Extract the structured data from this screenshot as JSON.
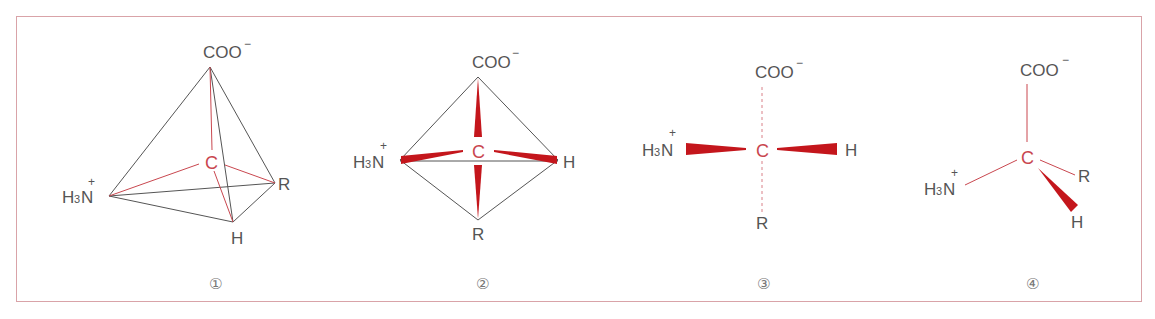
{
  "figure": {
    "border_color": "#d9a3a8",
    "bond_color_black": "#555555",
    "bond_color_red": "#c9474f",
    "wedge_color": "#c4161c",
    "diagrams": [
      {
        "id": "1",
        "caption": "①",
        "style": "tetrahedron",
        "center": "C",
        "top": {
          "main": "COO",
          "charge": "−"
        },
        "left": {
          "main_h": "H",
          "sub": "3",
          "main_n": "N",
          "charge": "+"
        },
        "right": "R",
        "bottom": "H"
      },
      {
        "id": "2",
        "caption": "②",
        "style": "square-planar-wedge",
        "center": "C",
        "top": {
          "main": "COO",
          "charge": "−"
        },
        "left": {
          "main_h": "H",
          "sub": "3",
          "main_n": "N",
          "charge": "+"
        },
        "right": "H",
        "bottom": "R"
      },
      {
        "id": "3",
        "caption": "③",
        "style": "fischer-wedge-dash",
        "center": "C",
        "top": {
          "main": "COO",
          "charge": "−"
        },
        "left": {
          "main_h": "H",
          "sub": "3",
          "main_n": "N",
          "charge": "+"
        },
        "right": "H",
        "bottom": "R"
      },
      {
        "id": "4",
        "caption": "④",
        "style": "wedge-line",
        "center": "C",
        "top": {
          "main": "COO",
          "charge": "−"
        },
        "left": {
          "main_h": "H",
          "sub": "3",
          "main_n": "N",
          "charge": "+"
        },
        "right": "R",
        "bottom": "H"
      }
    ]
  }
}
